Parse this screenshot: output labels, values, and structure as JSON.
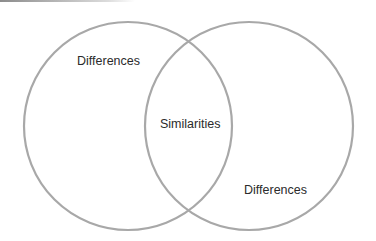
{
  "diagram": {
    "type": "venn",
    "stroke_color": "#a8a8a8",
    "text_color": "#2b2b2b",
    "circles": [
      {
        "name": "left",
        "cx": 128,
        "cy": 126,
        "r": 104
      },
      {
        "name": "right",
        "cx": 249,
        "cy": 126,
        "r": 104
      }
    ],
    "labels": {
      "left": "Differences",
      "center": "Similarities",
      "right": "Differences"
    }
  }
}
